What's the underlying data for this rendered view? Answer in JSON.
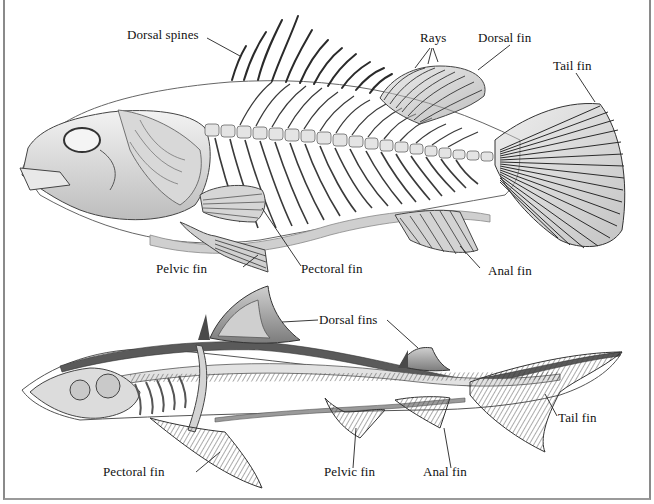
{
  "diagram": {
    "colors": {
      "bone": "#e6e6e6",
      "bone_shadow": "#9c9c9c",
      "ink": "#2a2a2a",
      "shark_band": "#555555",
      "frame": "#8a8a8a",
      "background": "#ffffff"
    },
    "bony_fish": {
      "name": "Bony fish skeleton",
      "labels": {
        "dorsal_spines": "Dorsal spines",
        "rays": "Rays",
        "dorsal_fin": "Dorsal fin",
        "tail_fin": "Tail fin",
        "pelvic_fin": "Pelvic fin",
        "pectoral_fin": "Pectoral fin",
        "anal_fin": "Anal fin"
      }
    },
    "shark": {
      "name": "Shark skeleton",
      "labels": {
        "dorsal_fins": "Dorsal fins",
        "tail_fin": "Tail fin",
        "pectoral_fin": "Pectoral fin",
        "pelvic_fin": "Pelvic fin",
        "anal_fin": "Anal fin"
      }
    }
  }
}
